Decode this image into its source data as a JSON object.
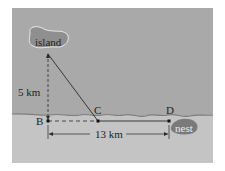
{
  "diagram": {
    "labels": {
      "island": "island",
      "nest": "nest",
      "vertical_distance": "5 km",
      "horizontal_distance": "13 km",
      "point_b": "B",
      "point_c": "C",
      "point_d": "D"
    },
    "colors": {
      "water": "#a9a9a9",
      "land": "#c4c4c4",
      "island_fill": "#8f8f8f",
      "nest_fill": "#7a7a7a",
      "shoreline": "#7d7d7d",
      "line": "#2a2a2a"
    }
  }
}
